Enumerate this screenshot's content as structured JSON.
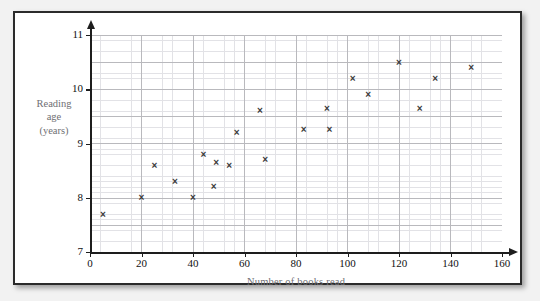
{
  "chart_data": {
    "type": "scatter",
    "title": "",
    "xlabel": "Number of books read",
    "ylabel": "Reading age (years)",
    "ylabel_lines": [
      "Reading",
      "age",
      "(years)"
    ],
    "xlim": [
      0,
      160
    ],
    "ylim": [
      7,
      11
    ],
    "xticks": [
      0,
      20,
      40,
      60,
      80,
      100,
      120,
      140,
      160
    ],
    "yticks": [
      7,
      8,
      9,
      10,
      11
    ],
    "xtick_labels": [
      "0",
      "20",
      "40",
      "60",
      "80",
      "100",
      "120",
      "140",
      "160"
    ],
    "ytick_labels": [
      "7",
      "8",
      "9",
      "10",
      "11"
    ],
    "grid": true,
    "grid_major_x_step": 20,
    "grid_major_y_step": 0.5,
    "grid_minor_x_step": 4,
    "grid_minor_y_step": 0.1,
    "legend": null,
    "marker": "x",
    "marker_color": "#3a3a3a",
    "points": [
      {
        "x": 5,
        "y": 7.7
      },
      {
        "x": 20,
        "y": 8.0
      },
      {
        "x": 25,
        "y": 8.6
      },
      {
        "x": 33,
        "y": 8.3
      },
      {
        "x": 40,
        "y": 8.0
      },
      {
        "x": 44,
        "y": 8.8
      },
      {
        "x": 48,
        "y": 8.2
      },
      {
        "x": 49,
        "y": 8.65
      },
      {
        "x": 54,
        "y": 8.6
      },
      {
        "x": 57,
        "y": 9.2
      },
      {
        "x": 66,
        "y": 9.6
      },
      {
        "x": 68,
        "y": 8.7
      },
      {
        "x": 83,
        "y": 9.25
      },
      {
        "x": 92,
        "y": 9.65
      },
      {
        "x": 93,
        "y": 9.25
      },
      {
        "x": 102,
        "y": 10.2
      },
      {
        "x": 108,
        "y": 9.9
      },
      {
        "x": 120,
        "y": 10.5
      },
      {
        "x": 128,
        "y": 9.65
      },
      {
        "x": 134,
        "y": 10.2
      },
      {
        "x": 148,
        "y": 10.4
      }
    ]
  },
  "colors": {
    "frame_border": "#2b2b2b",
    "page_background": "#f2f2f2",
    "plot_background": "#ffffff",
    "grid_major": "#b9b9bd",
    "grid_minor": "#e2e2e6",
    "axis": "#1d1d1d",
    "axis_title": "#6f6f74",
    "tick_label": "#111111"
  }
}
